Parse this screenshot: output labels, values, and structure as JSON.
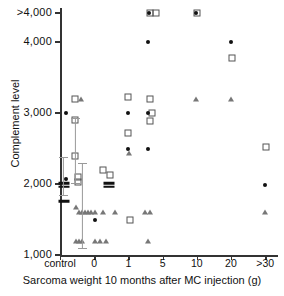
{
  "chart_data": {
    "type": "scatter",
    "title": "",
    "xlabel": "Sarcoma weight 10 months after MC injection (g)",
    "ylabel": "Complement level",
    "grid": false,
    "legend": "none",
    "ylim": [
      1000,
      4300
    ],
    "ytick_labels": [
      ">4,000",
      "4,000",
      "3,000",
      "2,000",
      "1,000"
    ],
    "ytick_values": [
      4300,
      4000,
      3000,
      2000,
      1000
    ],
    "xtick_labels": [
      "control",
      "0",
      "1",
      "5",
      "10",
      "20",
      ">30"
    ],
    "xtick_values": [
      0,
      1,
      2,
      3,
      4,
      5,
      6
    ],
    "marker_types": [
      "square",
      "circle",
      "triangle",
      "bar"
    ],
    "series": [
      {
        "name": "open-square",
        "marker": "square",
        "points": [
          {
            "x": 0.45,
            "y": 3200
          },
          {
            "x": 0.45,
            "y": 2900
          },
          {
            "x": 0.45,
            "y": 2400
          },
          {
            "x": 0.52,
            "y": 2100
          },
          {
            "x": 0.52,
            "y": 2030
          },
          {
            "x": 1.25,
            "y": 2200
          },
          {
            "x": 1.45,
            "y": 2120
          },
          {
            "x": 1.98,
            "y": 3220
          },
          {
            "x": 1.98,
            "y": 2720
          },
          {
            "x": 2.62,
            "y": 4300
          },
          {
            "x": 2.82,
            "y": 4300
          },
          {
            "x": 2.62,
            "y": 3200
          },
          {
            "x": 2.62,
            "y": 2890
          },
          {
            "x": 2.68,
            "y": 3000
          },
          {
            "x": 2.06,
            "y": 1490
          },
          {
            "x": 4.02,
            "y": 4300
          },
          {
            "x": 5.02,
            "y": 3780
          },
          {
            "x": 6.02,
            "y": 2520
          }
        ]
      },
      {
        "name": "filled-circle",
        "marker": "circle",
        "points": [
          {
            "x": 0.18,
            "y": 3000
          },
          {
            "x": 0.18,
            "y": 2070
          },
          {
            "x": 1.02,
            "y": 1490
          },
          {
            "x": 1.98,
            "y": 3000
          },
          {
            "x": 1.98,
            "y": 2500
          },
          {
            "x": 2.58,
            "y": 4000
          },
          {
            "x": 2.56,
            "y": 3000
          },
          {
            "x": 2.58,
            "y": 2500
          },
          {
            "x": 2.6,
            "y": 4300
          },
          {
            "x": 3.98,
            "y": 4300
          },
          {
            "x": 5.0,
            "y": 4000
          },
          {
            "x": 6.0,
            "y": 1990
          }
        ]
      },
      {
        "name": "open-triangle",
        "marker": "triangle",
        "points": [
          {
            "x": 0.62,
            "y": 3200
          },
          {
            "x": 0.48,
            "y": 1680
          },
          {
            "x": 0.55,
            "y": 1600
          },
          {
            "x": 0.65,
            "y": 1600
          },
          {
            "x": 0.74,
            "y": 1600
          },
          {
            "x": 0.83,
            "y": 1600
          },
          {
            "x": 0.92,
            "y": 1600
          },
          {
            "x": 1.02,
            "y": 1600
          },
          {
            "x": 1.26,
            "y": 1600
          },
          {
            "x": 1.6,
            "y": 1600
          },
          {
            "x": 2.02,
            "y": 2430
          },
          {
            "x": 2.5,
            "y": 1600
          },
          {
            "x": 2.62,
            "y": 1600
          },
          {
            "x": 0.48,
            "y": 1200
          },
          {
            "x": 0.56,
            "y": 1200
          },
          {
            "x": 0.64,
            "y": 1200
          },
          {
            "x": 1.02,
            "y": 1200
          },
          {
            "x": 1.18,
            "y": 1200
          },
          {
            "x": 1.34,
            "y": 1200
          },
          {
            "x": 2.58,
            "y": 1200
          },
          {
            "x": 3.98,
            "y": 3200
          },
          {
            "x": 5.0,
            "y": 3200
          },
          {
            "x": 6.0,
            "y": 1600
          }
        ]
      },
      {
        "name": "mean-bar",
        "marker": "bar",
        "points": [
          {
            "x": 0.12,
            "y": 2010
          },
          {
            "x": 0.12,
            "y": 1960
          },
          {
            "x": 0.12,
            "y": 1760
          },
          {
            "x": 1.42,
            "y": 2010
          },
          {
            "x": 1.42,
            "y": 1960
          }
        ]
      }
    ],
    "error_bars": [
      {
        "x": 0.1,
        "y_top": 2380,
        "y_bottom": 1830
      },
      {
        "x": 0.45,
        "y_top": 2930,
        "y_bottom": 2000
      },
      {
        "x": 0.66,
        "y_top": 2300,
        "y_bottom": 1080
      }
    ]
  }
}
